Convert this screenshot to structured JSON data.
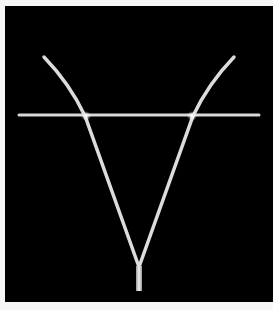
{
  "image": {
    "description": "Glowing white V-shaped line figure with curved upper arms and a short vertical stem, crossed by a horizontal line, on a black panel",
    "background_color": "#000000",
    "border_color": "#f6f6f6",
    "line_color": "#e6e6e6",
    "glow_color": "#ffffff"
  },
  "shapes": {
    "horizontal_line": {
      "x1": 19,
      "y1": 115,
      "x2": 259,
      "y2": 115
    },
    "left_arm": {
      "start": [
        44,
        57
      ],
      "cross": [
        85,
        116
      ],
      "apex": [
        139,
        267
      ]
    },
    "right_arm": {
      "start": [
        234,
        57
      ],
      "cross": [
        193,
        116
      ],
      "apex": [
        139,
        267
      ]
    },
    "stem": {
      "x": 136,
      "y": 267,
      "width": 6,
      "height": 24
    }
  }
}
